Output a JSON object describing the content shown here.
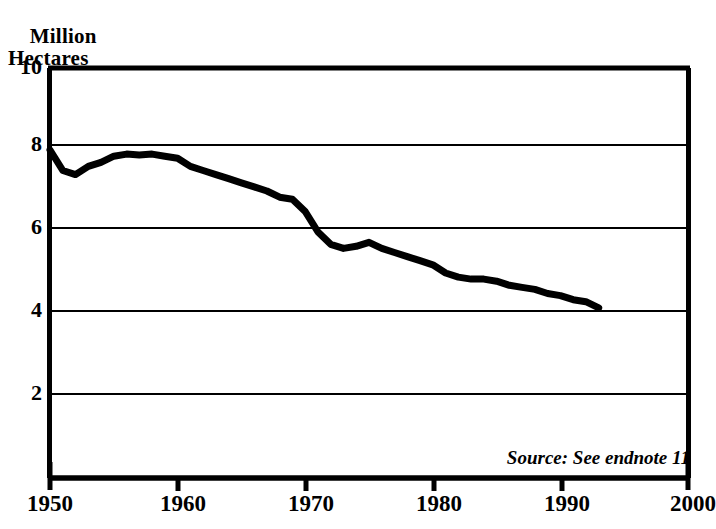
{
  "chart_data": {
    "type": "line",
    "title": "",
    "ylabel": "Million Hectares",
    "ylabel_line1": "Million",
    "ylabel_line2": "Hectares",
    "xlabel": "",
    "xlim": [
      1950,
      2000
    ],
    "ylim": [
      0,
      10
    ],
    "xticks": [
      1950,
      1960,
      1970,
      1980,
      1990,
      2000
    ],
    "yticks": [
      2,
      4,
      6,
      8,
      10
    ],
    "ytick_labels": [
      "2",
      "4",
      "6",
      "8",
      "10"
    ],
    "xtick_labels": [
      "1950",
      "1960",
      "1970",
      "1980",
      "1990",
      "2000"
    ],
    "grid": "horizontal",
    "legend": "none",
    "annotation": "Source: See endnote 11",
    "line_color": "#000000",
    "line_width_px": 7,
    "series": [
      {
        "name": "Area",
        "x": [
          1950,
          1951,
          1952,
          1953,
          1954,
          1955,
          1956,
          1957,
          1958,
          1959,
          1960,
          1961,
          1962,
          1963,
          1964,
          1965,
          1966,
          1967,
          1968,
          1969,
          1970,
          1971,
          1972,
          1973,
          1974,
          1975,
          1976,
          1977,
          1978,
          1979,
          1980,
          1981,
          1982,
          1983,
          1984,
          1985,
          1986,
          1987,
          1988,
          1989,
          1990,
          1991,
          1992,
          1993
        ],
        "values": [
          8.0,
          7.5,
          7.4,
          7.6,
          7.7,
          7.85,
          7.9,
          7.88,
          7.9,
          7.85,
          7.8,
          7.6,
          7.5,
          7.4,
          7.3,
          7.2,
          7.1,
          7.0,
          6.85,
          6.8,
          6.5,
          6.0,
          5.7,
          5.6,
          5.65,
          5.75,
          5.6,
          5.5,
          5.4,
          5.3,
          5.2,
          5.0,
          4.9,
          4.85,
          4.85,
          4.8,
          4.7,
          4.65,
          4.6,
          4.5,
          4.45,
          4.35,
          4.3,
          4.15
        ]
      }
    ]
  },
  "axes": {
    "y_title_line1": "Million",
    "y_title_line2": "Hectares",
    "y_labels": [
      "10",
      "8",
      "6",
      "4",
      "2"
    ],
    "x_labels": [
      "1950",
      "1960",
      "1970",
      "1980",
      "1990",
      "2000"
    ]
  },
  "notes": {
    "source": "Source: See endnote 11"
  }
}
